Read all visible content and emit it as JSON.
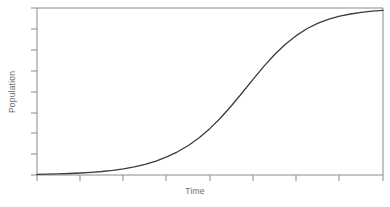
{
  "chart_data": {
    "type": "line",
    "title": "",
    "subtitle": "",
    "xlabel": "Time",
    "ylabel": "Population",
    "grid": false,
    "legend": null,
    "annotations": [],
    "axis": {
      "x_range": [
        0,
        8
      ],
      "y_range": [
        0,
        1
      ],
      "x_tick_labels": [
        "",
        "",
        "",
        "",
        "",
        "",
        "",
        "",
        ""
      ],
      "y_tick_labels": [
        "",
        "",
        "",
        "",
        "",
        "",
        "",
        "",
        ""
      ],
      "x_tick_count": 9,
      "y_tick_count": 9,
      "tick_direction": "out"
    },
    "series": [
      {
        "name": "Logistic growth",
        "curve": "logistic",
        "color": "#3c3c3c",
        "line_width": 1.3,
        "x": [
          0.0,
          0.25,
          0.5,
          0.75,
          1.0,
          1.25,
          1.5,
          1.75,
          2.0,
          2.25,
          2.5,
          2.75,
          3.0,
          3.25,
          3.5,
          3.75,
          4.0,
          4.25,
          4.5,
          4.75,
          5.0,
          5.25,
          5.5,
          5.75,
          6.0,
          6.25,
          6.5,
          6.75,
          7.0,
          7.25,
          7.5,
          7.75,
          8.0
        ],
        "y": [
          0.004,
          0.005,
          0.007,
          0.009,
          0.012,
          0.016,
          0.021,
          0.028,
          0.037,
          0.049,
          0.064,
          0.083,
          0.108,
          0.139,
          0.177,
          0.223,
          0.279,
          0.343,
          0.416,
          0.494,
          0.574,
          0.652,
          0.723,
          0.785,
          0.836,
          0.877,
          0.909,
          0.933,
          0.951,
          0.964,
          0.974,
          0.981,
          0.986
        ]
      }
    ]
  },
  "style": {
    "frame_color": "#8a8a8a",
    "tick_color": "#8a8a8a",
    "curve_color": "#3c3c3c",
    "background": "#ffffff",
    "label_color": "#6b6b6b"
  }
}
